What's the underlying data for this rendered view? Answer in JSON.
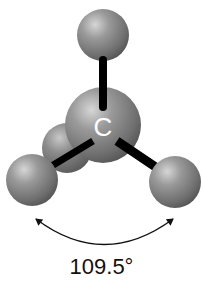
{
  "central_atom": {
    "symbol": "C"
  },
  "bond_angle": {
    "label": "109.5°",
    "value": 109.5,
    "unit": "degrees"
  },
  "atoms": [
    {
      "id": "top",
      "role": "substituent"
    },
    {
      "id": "back-left",
      "role": "substituent"
    },
    {
      "id": "front-left",
      "role": "substituent"
    },
    {
      "id": "front-right",
      "role": "substituent"
    },
    {
      "id": "center",
      "role": "central",
      "symbol": "C"
    }
  ],
  "colors": {
    "atom_light": "#d8d8d8",
    "atom_mid": "#8a8a8a",
    "atom_dark": "#4a4a4a",
    "bond": "#000000",
    "text": "#111111",
    "background": "#ffffff"
  }
}
